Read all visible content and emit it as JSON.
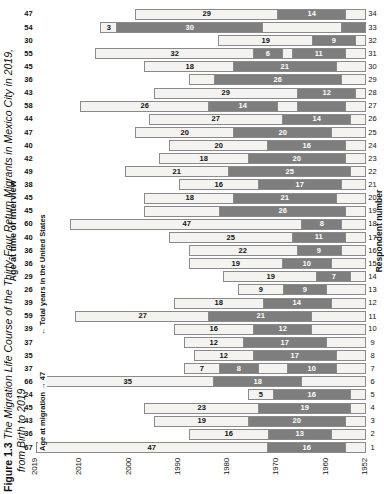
{
  "caption": {
    "figure_number": "Figure 1.3",
    "line1": "The Migration Life Course of the Thirty-Four Return Migrants in Mexico City in 2019,",
    "line2": "from Birth to 2019"
  },
  "axes": {
    "top_title": "Age at time of interview",
    "bottom_title": "Respondent number",
    "year_ticks": [
      "1952",
      "1960",
      "1970",
      "1980",
      "1990",
      "2000",
      "2010",
      "2019"
    ],
    "year_min": 1952,
    "year_max": 2019
  },
  "annotations": {
    "age_at_migration": "Age at migration → 47",
    "total_years_us": "← Total years in the United States"
  },
  "legend": {
    "mexico_color": "#f4f3f0",
    "us_color": "#7e7e7e",
    "border_color": "#8a8a8a"
  },
  "chart_data": {
    "type": "bar",
    "title": "The Migration Life Course of the Thirty-Four Return Migrants in Mexico City in 2019, from Birth to 2019",
    "xlabel": "Respondent number",
    "ylabel": "Year",
    "ylim": [
      1952,
      2019
    ],
    "grid": false,
    "legend_position": "none",
    "categories": [
      1,
      2,
      3,
      4,
      5,
      6,
      7,
      8,
      9,
      10,
      11,
      12,
      13,
      14,
      15,
      16,
      17,
      18,
      19,
      20,
      21,
      22,
      23,
      24,
      25,
      26,
      27,
      28,
      29,
      30,
      31,
      32,
      33,
      34
    ],
    "age_at_interview": [
      67,
      36,
      43,
      45,
      24,
      66,
      37,
      35,
      37,
      39,
      59,
      39,
      26,
      29,
      36,
      36,
      40,
      60,
      45,
      45,
      38,
      49,
      42,
      40,
      47,
      44,
      58,
      43,
      36,
      45,
      55,
      30,
      54,
      47
    ],
    "birth_year": [
      1952,
      1983,
      1976,
      1974,
      1995,
      1953,
      1982,
      1984,
      1982,
      1980,
      1960,
      1980,
      1993,
      1990,
      1983,
      1983,
      1979,
      1959,
      1974,
      1974,
      1981,
      1970,
      1977,
      1979,
      1972,
      1975,
      1961,
      1976,
      1983,
      1974,
      1964,
      1989,
      1965,
      1972
    ],
    "series": [
      {
        "name": "Years in Mexico (before migration)",
        "color": "#f4f3f0"
      },
      {
        "name": "Total years in the United States",
        "color": "#7e7e7e"
      }
    ],
    "respondents": [
      {
        "id": 1,
        "age": 67,
        "birth": 1952,
        "segments": [
          {
            "type": "mx",
            "years": 47,
            "label": "47"
          },
          {
            "type": "us",
            "years": 16,
            "label": "16"
          },
          {
            "type": "mx",
            "years": 4,
            "label": ""
          }
        ]
      },
      {
        "id": 2,
        "age": 36,
        "birth": 1983,
        "segments": [
          {
            "type": "mx",
            "years": 16,
            "label": "16"
          },
          {
            "type": "us",
            "years": 13,
            "label": "13"
          },
          {
            "type": "mx",
            "years": 7,
            "label": ""
          }
        ]
      },
      {
        "id": 3,
        "age": 43,
        "birth": 1976,
        "segments": [
          {
            "type": "mx",
            "years": 19,
            "label": "19"
          },
          {
            "type": "us",
            "years": 20,
            "label": "20"
          },
          {
            "type": "mx",
            "years": 4,
            "label": ""
          }
        ]
      },
      {
        "id": 4,
        "age": 45,
        "birth": 1974,
        "segments": [
          {
            "type": "mx",
            "years": 23,
            "label": "23"
          },
          {
            "type": "us",
            "years": 19,
            "label": "19"
          },
          {
            "type": "mx",
            "years": 3,
            "label": ""
          }
        ]
      },
      {
        "id": 5,
        "age": 24,
        "birth": 1995,
        "segments": [
          {
            "type": "mx",
            "years": 5,
            "label": "5"
          },
          {
            "type": "us",
            "years": 16,
            "label": "16"
          },
          {
            "type": "mx",
            "years": 3,
            "label": ""
          }
        ]
      },
      {
        "id": 6,
        "age": 66,
        "birth": 1953,
        "segments": [
          {
            "type": "mx",
            "years": 35,
            "label": "35"
          },
          {
            "type": "us",
            "years": 18,
            "label": "18"
          },
          {
            "type": "mx",
            "years": 13,
            "label": ""
          }
        ]
      },
      {
        "id": 7,
        "age": 37,
        "birth": 1982,
        "segments": [
          {
            "type": "mx",
            "years": 7,
            "label": "7"
          },
          {
            "type": "us",
            "years": 8,
            "label": "8"
          },
          {
            "type": "mx",
            "years": 6,
            "label": ""
          },
          {
            "type": "us",
            "years": 10,
            "label": "10"
          },
          {
            "type": "mx",
            "years": 6,
            "label": ""
          }
        ]
      },
      {
        "id": 8,
        "age": 35,
        "birth": 1984,
        "segments": [
          {
            "type": "mx",
            "years": 12,
            "label": "12"
          },
          {
            "type": "us",
            "years": 17,
            "label": "17"
          },
          {
            "type": "mx",
            "years": 6,
            "label": ""
          }
        ]
      },
      {
        "id": 9,
        "age": 37,
        "birth": 1982,
        "segments": [
          {
            "type": "mx",
            "years": 12,
            "label": "12"
          },
          {
            "type": "us",
            "years": 17,
            "label": "17"
          },
          {
            "type": "mx",
            "years": 8,
            "label": ""
          }
        ]
      },
      {
        "id": 10,
        "age": 39,
        "birth": 1980,
        "segments": [
          {
            "type": "mx",
            "years": 16,
            "label": "16"
          },
          {
            "type": "us",
            "years": 12,
            "label": "12"
          },
          {
            "type": "mx",
            "years": 11,
            "label": ""
          }
        ]
      },
      {
        "id": 11,
        "age": 59,
        "birth": 1960,
        "segments": [
          {
            "type": "mx",
            "years": 27,
            "label": "27"
          },
          {
            "type": "us",
            "years": 21,
            "label": "21"
          },
          {
            "type": "mx",
            "years": 11,
            "label": ""
          }
        ]
      },
      {
        "id": 12,
        "age": 39,
        "birth": 1980,
        "segments": [
          {
            "type": "mx",
            "years": 18,
            "label": "18"
          },
          {
            "type": "us",
            "years": 14,
            "label": "14"
          },
          {
            "type": "mx",
            "years": 7,
            "label": ""
          }
        ]
      },
      {
        "id": 13,
        "age": 26,
        "birth": 1993,
        "segments": [
          {
            "type": "mx",
            "years": 9,
            "label": "9"
          },
          {
            "type": "us",
            "years": 9,
            "label": "9"
          },
          {
            "type": "mx",
            "years": 8,
            "label": ""
          }
        ]
      },
      {
        "id": 14,
        "age": 29,
        "birth": 1990,
        "segments": [
          {
            "type": "mx",
            "years": 19,
            "label": "19"
          },
          {
            "type": "us",
            "years": 7,
            "label": "7"
          },
          {
            "type": "mx",
            "years": 3,
            "label": ""
          }
        ]
      },
      {
        "id": 15,
        "age": 36,
        "birth": 1983,
        "segments": [
          {
            "type": "mx",
            "years": 19,
            "label": "19"
          },
          {
            "type": "us",
            "years": 10,
            "label": "10"
          },
          {
            "type": "mx",
            "years": 7,
            "label": ""
          }
        ]
      },
      {
        "id": 16,
        "age": 36,
        "birth": 1983,
        "segments": [
          {
            "type": "mx",
            "years": 22,
            "label": "22"
          },
          {
            "type": "us",
            "years": 9,
            "label": "9"
          },
          {
            "type": "mx",
            "years": 5,
            "label": ""
          }
        ]
      },
      {
        "id": 17,
        "age": 40,
        "birth": 1979,
        "segments": [
          {
            "type": "mx",
            "years": 25,
            "label": "25"
          },
          {
            "type": "us",
            "years": 11,
            "label": "11"
          },
          {
            "type": "mx",
            "years": 4,
            "label": ""
          }
        ]
      },
      {
        "id": 18,
        "age": 60,
        "birth": 1959,
        "segments": [
          {
            "type": "mx",
            "years": 47,
            "label": "47"
          },
          {
            "type": "us",
            "years": 8,
            "label": "8"
          },
          {
            "type": "mx",
            "years": 5,
            "label": ""
          }
        ]
      },
      {
        "id": 19,
        "age": 45,
        "birth": 1974,
        "segments": [
          {
            "type": "mx",
            "years": 15,
            "label": ""
          },
          {
            "type": "us",
            "years": 26,
            "label": "26"
          },
          {
            "type": "mx",
            "years": 4,
            "label": ""
          }
        ]
      },
      {
        "id": 20,
        "age": 45,
        "birth": 1974,
        "segments": [
          {
            "type": "mx",
            "years": 18,
            "label": "18"
          },
          {
            "type": "us",
            "years": 21,
            "label": "21"
          },
          {
            "type": "mx",
            "years": 6,
            "label": ""
          }
        ]
      },
      {
        "id": 21,
        "age": 38,
        "birth": 1981,
        "segments": [
          {
            "type": "mx",
            "years": 16,
            "label": "16"
          },
          {
            "type": "us",
            "years": 17,
            "label": "17"
          },
          {
            "type": "mx",
            "years": 5,
            "label": ""
          }
        ]
      },
      {
        "id": 22,
        "age": 49,
        "birth": 1970,
        "segments": [
          {
            "type": "mx",
            "years": 21,
            "label": "21"
          },
          {
            "type": "us",
            "years": 25,
            "label": "25"
          },
          {
            "type": "mx",
            "years": 3,
            "label": ""
          }
        ]
      },
      {
        "id": 23,
        "age": 42,
        "birth": 1977,
        "segments": [
          {
            "type": "mx",
            "years": 18,
            "label": "18"
          },
          {
            "type": "us",
            "years": 20,
            "label": "20"
          },
          {
            "type": "mx",
            "years": 4,
            "label": ""
          }
        ]
      },
      {
        "id": 24,
        "age": 40,
        "birth": 1979,
        "segments": [
          {
            "type": "mx",
            "years": 20,
            "label": "20"
          },
          {
            "type": "us",
            "years": 16,
            "label": "16"
          },
          {
            "type": "mx",
            "years": 4,
            "label": ""
          }
        ]
      },
      {
        "id": 25,
        "age": 47,
        "birth": 1972,
        "segments": [
          {
            "type": "mx",
            "years": 20,
            "label": "20"
          },
          {
            "type": "us",
            "years": 20,
            "label": "20"
          },
          {
            "type": "mx",
            "years": 7,
            "label": ""
          }
        ]
      },
      {
        "id": 26,
        "age": 44,
        "birth": 1975,
        "segments": [
          {
            "type": "mx",
            "years": 27,
            "label": "27"
          },
          {
            "type": "us",
            "years": 14,
            "label": "14"
          },
          {
            "type": "mx",
            "years": 3,
            "label": ""
          }
        ]
      },
      {
        "id": 27,
        "age": 58,
        "birth": 1961,
        "segments": [
          {
            "type": "mx",
            "years": 26,
            "label": "26"
          },
          {
            "type": "us",
            "years": 14,
            "label": "14"
          },
          {
            "type": "mx",
            "years": 4,
            "label": ""
          },
          {
            "type": "us",
            "years": 10,
            "label": ""
          },
          {
            "type": "mx",
            "years": 4,
            "label": ""
          }
        ]
      },
      {
        "id": 28,
        "age": 43,
        "birth": 1976,
        "segments": [
          {
            "type": "mx",
            "years": 29,
            "label": "29"
          },
          {
            "type": "us",
            "years": 12,
            "label": "12"
          },
          {
            "type": "mx",
            "years": 2,
            "label": ""
          }
        ]
      },
      {
        "id": 29,
        "age": 36,
        "birth": 1983,
        "segments": [
          {
            "type": "mx",
            "years": 5,
            "label": ""
          },
          {
            "type": "us",
            "years": 26,
            "label": "26"
          },
          {
            "type": "mx",
            "years": 5,
            "label": ""
          }
        ]
      },
      {
        "id": 30,
        "age": 45,
        "birth": 1974,
        "segments": [
          {
            "type": "mx",
            "years": 18,
            "label": "18"
          },
          {
            "type": "us",
            "years": 21,
            "label": "21"
          },
          {
            "type": "mx",
            "years": 6,
            "label": ""
          }
        ]
      },
      {
        "id": 31,
        "age": 55,
        "birth": 1964,
        "segments": [
          {
            "type": "mx",
            "years": 32,
            "label": "32"
          },
          {
            "type": "us",
            "years": 6,
            "label": "6"
          },
          {
            "type": "mx",
            "years": 2,
            "label": ""
          },
          {
            "type": "us",
            "years": 11,
            "label": "11"
          },
          {
            "type": "mx",
            "years": 4,
            "label": ""
          }
        ]
      },
      {
        "id": 32,
        "age": 30,
        "birth": 1989,
        "segments": [
          {
            "type": "mx",
            "years": 19,
            "label": "19"
          },
          {
            "type": "us",
            "years": 9,
            "label": "9"
          },
          {
            "type": "mx",
            "years": 2,
            "label": ""
          }
        ]
      },
      {
        "id": 33,
        "age": 54,
        "birth": 1965,
        "segments": [
          {
            "type": "mx",
            "years": 3,
            "label": "3"
          },
          {
            "type": "us",
            "years": 30,
            "label": "30"
          },
          {
            "type": "mx",
            "years": 16,
            "label": ""
          },
          {
            "type": "us",
            "years": 5,
            "label": ""
          }
        ]
      },
      {
        "id": 34,
        "age": 47,
        "birth": 1972,
        "segments": [
          {
            "type": "mx",
            "years": 29,
            "label": "29"
          },
          {
            "type": "us",
            "years": 14,
            "label": "14"
          },
          {
            "type": "mx",
            "years": 4,
            "label": ""
          }
        ]
      }
    ]
  }
}
